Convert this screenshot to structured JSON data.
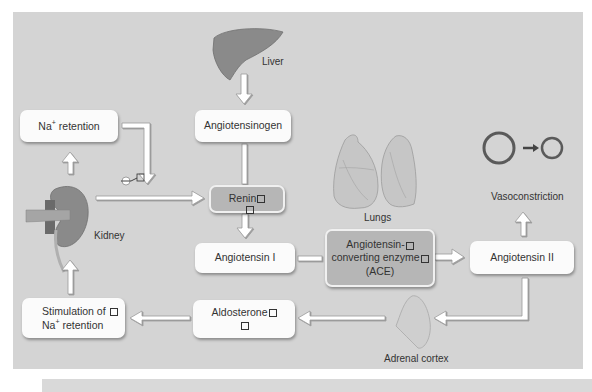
{
  "diagram": {
    "organs": {
      "liver": "Liver",
      "kidney": "Kidney",
      "lungs": "Lungs",
      "adrenal": "Adrenal cortex"
    },
    "nodes": {
      "na_retention": {
        "prefix": "Na",
        "sup": "+",
        "suffix": " retention"
      },
      "angiotensinogen": "Angiotensinogen",
      "renin": "Renin",
      "angiotensin_1": "Angiotensin I",
      "ace_line1": "Angiotensin-",
      "ace_line2": "converting enzyme",
      "ace_line3": "(ACE)",
      "angiotensin_2": "Angiotensin II",
      "vasoconstriction": "Vasoconstriction",
      "aldosterone": "Aldosterone",
      "stimulation_line1": "Stimulation of ",
      "stimulation_prefix": "Na",
      "stimulation_sup": "+",
      "stimulation_suffix": " retention"
    },
    "inhibition_symbol": "−",
    "edges": [
      {
        "from": "Liver",
        "to": "Angiotensinogen"
      },
      {
        "from": "Angiotensinogen",
        "to": "Renin"
      },
      {
        "from": "Kidney",
        "to": "Renin"
      },
      {
        "from": "Kidney",
        "to": "Na+ retention"
      },
      {
        "from": "Na+ retention",
        "to": "Renin",
        "type": "inhibition"
      },
      {
        "from": "Renin",
        "to": "Angiotensin I"
      },
      {
        "from": "Angiotensin I",
        "to": "ACE"
      },
      {
        "from": "ACE",
        "to": "Angiotensin II"
      },
      {
        "from": "Angiotensin II",
        "to": "Vasoconstriction"
      },
      {
        "from": "Angiotensin II",
        "to": "Adrenal cortex"
      },
      {
        "from": "Adrenal cortex",
        "to": "Aldosterone"
      },
      {
        "from": "Aldosterone",
        "to": "Stimulation of Na+ retention"
      },
      {
        "from": "Stimulation of Na+ retention",
        "to": "Kidney"
      }
    ],
    "colors": {
      "background": "#d4d4d4",
      "box": "#fbfbfb",
      "box_dark": "#b6b6b6",
      "organ": "#8a8a8a",
      "arrow_fill": "#ffffff",
      "arrow_stroke": "#9a9a9a"
    }
  }
}
